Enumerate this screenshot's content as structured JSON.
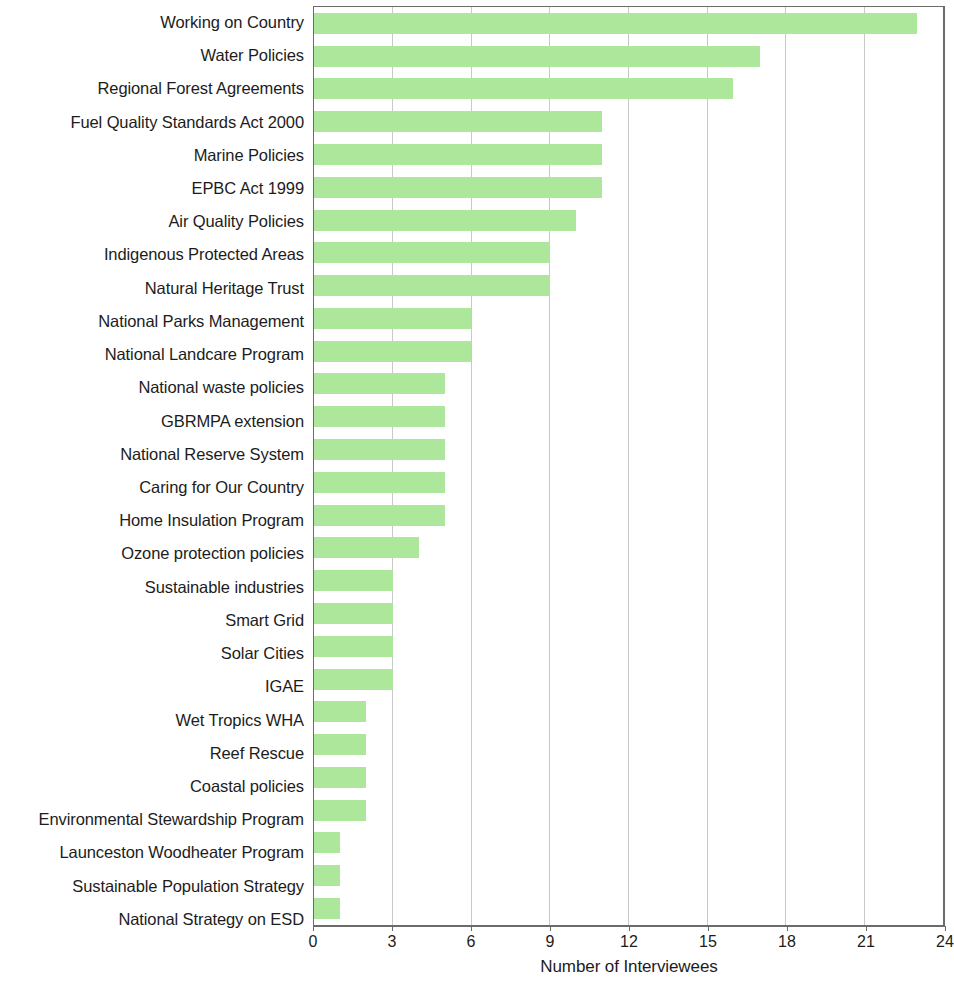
{
  "chart_data": {
    "type": "bar",
    "orientation": "horizontal",
    "title": "",
    "subtitle": "",
    "xlabel": "Number of Interviewees",
    "ylabel": "",
    "xlim": [
      0,
      24
    ],
    "xticks": [
      0,
      3,
      6,
      9,
      12,
      15,
      18,
      21,
      24
    ],
    "xtick_labels": [
      "0",
      "3",
      "6",
      "9",
      "12",
      "15",
      "18",
      "21",
      "24"
    ],
    "grid": "vertical",
    "legend": "none",
    "bar_color": "#ace79c",
    "axis_color": "#6b6b6b",
    "grid_color": "#c9c9c9",
    "categories": [
      "Working on Country",
      "Water Policies",
      "Regional Forest Agreements",
      "Fuel Quality Standards Act 2000",
      "Marine Policies",
      "EPBC Act 1999",
      "Air Quality Policies",
      "Indigenous Protected Areas",
      "Natural Heritage Trust",
      "National Parks Management",
      "National Landcare Program",
      "National waste policies",
      "GBRMPA extension",
      "National Reserve System",
      "Caring for Our Country",
      "Home Insulation Program",
      "Ozone protection policies",
      "Sustainable industries",
      "Smart Grid",
      "Solar Cities",
      "IGAE",
      "Wet Tropics WHA",
      "Reef Rescue",
      "Coastal policies",
      "Environmental Stewardship Program",
      "Launceston Woodheater Program",
      "Sustainable Population Strategy",
      "National Strategy on ESD"
    ],
    "values": [
      23,
      17,
      16,
      11,
      11,
      11,
      10,
      9,
      9,
      6,
      6,
      5,
      5,
      5,
      5,
      5,
      4,
      3,
      3,
      3,
      3,
      2,
      2,
      2,
      2,
      1,
      1,
      1
    ]
  }
}
